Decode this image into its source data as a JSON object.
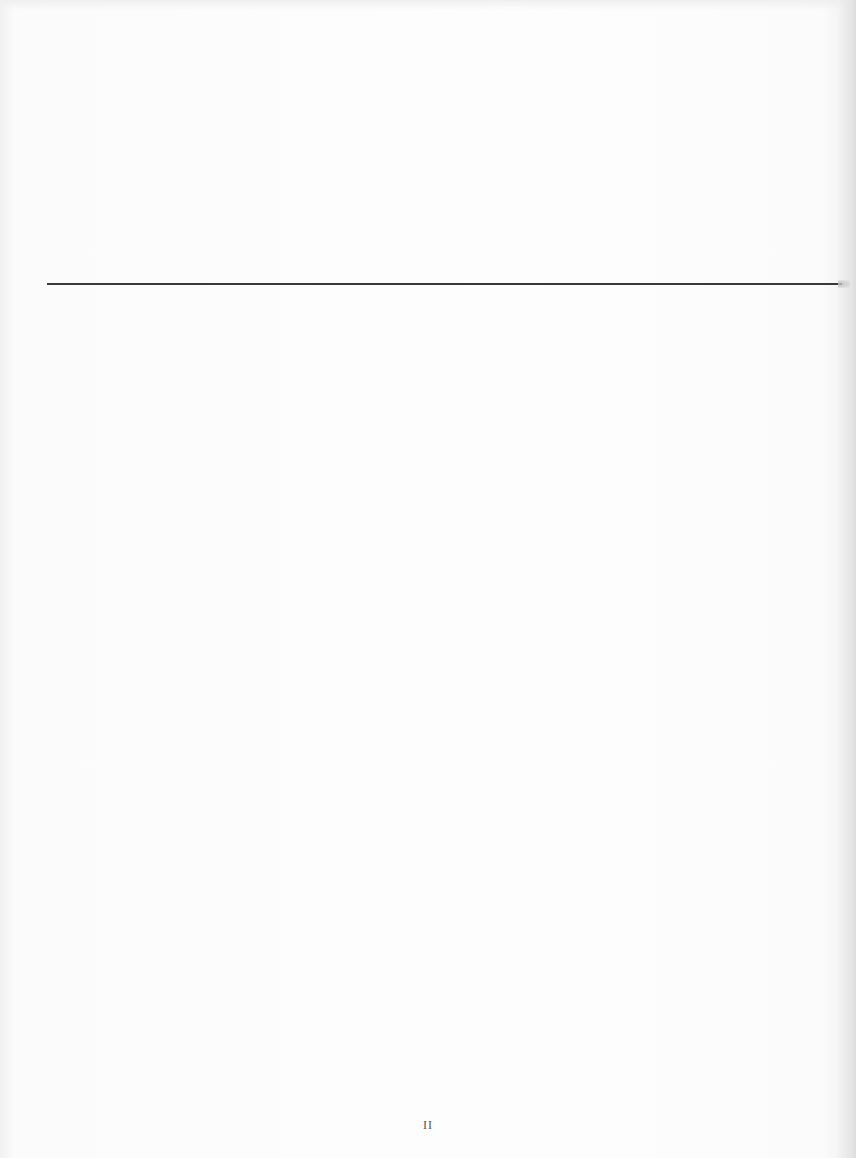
{
  "document": {
    "type": "scanned-book-page",
    "rule": {
      "color": "#3a3a3a",
      "orientation": "horizontal"
    },
    "footer": {
      "page_number": "II"
    }
  }
}
